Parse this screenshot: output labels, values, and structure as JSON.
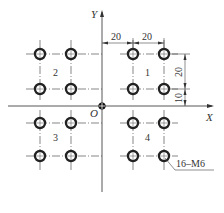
{
  "diagram": {
    "axes": {
      "x_label": "X",
      "y_label": "Y",
      "origin_label": "O"
    },
    "quadrant_labels": [
      "1",
      "2",
      "3",
      "4"
    ],
    "dimensions": {
      "horizontal": [
        "20",
        "20"
      ],
      "vertical": [
        "20",
        "10"
      ]
    },
    "callout": "16–M6",
    "hole_count": 16,
    "colors": {
      "line": "#333333",
      "hole": "#222222",
      "background": "#ffffff"
    }
  }
}
